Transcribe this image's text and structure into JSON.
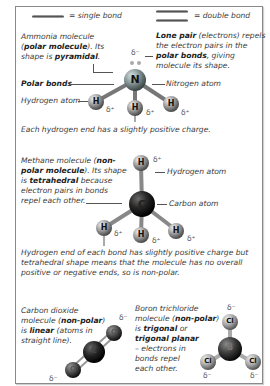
{
  "legend": {
    "single_bond": "= single bond",
    "double_bond": "= double bond"
  },
  "ammonia": {
    "desc_1": "Ammonia molecule",
    "desc_2a": "(",
    "desc_2b": "polar molecule",
    "desc_2c": "). Its",
    "desc_3a": "shape is ",
    "desc_3b": "pyramidal",
    "desc_3c": ".",
    "lone_pair_1a": "Lone pair",
    "lone_pair_1b": " (electrons) repels",
    "lone_pair_2": "the electron pairs in the",
    "lone_pair_3a": "polar bonds",
    "lone_pair_3b": ", giving",
    "lone_pair_4": "molecule its shape.",
    "polar_bonds_label": "Polar bonds",
    "nitrogen_label": "Nitrogen atom",
    "hydrogen_label": "Hydrogen atom",
    "caption": "Each hydrogen end has a slightly positive charge.",
    "atoms": {
      "center": "N",
      "h": "H"
    },
    "charges": {
      "neg": "δ⁻",
      "pos": "δ⁺"
    }
  },
  "methane": {
    "desc_1a": "Methane molecule (",
    "desc_1b": "non-",
    "desc_2a": "polar molecule",
    "desc_2b": "). Its shape",
    "desc_3a": "is ",
    "desc_3b": "tetrahedral",
    "desc_3c": " because",
    "desc_4": "electron pairs in bonds",
    "desc_5": "repel each other.",
    "hydrogen_label": "Hydrogen atom",
    "carbon_label": "Carbon atom",
    "caption_1": "Hydrogen end of each bond has slightly positive charge but",
    "caption_2": "tetrahedral shape means that the molecule has no overall",
    "caption_3": "positive or negative ends, so is non-polar.",
    "atoms": {
      "center": "C",
      "h": "H"
    },
    "charges": {
      "pos": "δ⁺"
    }
  },
  "co2": {
    "desc_1": "Carbon dioxide",
    "desc_2a": "molecule (",
    "desc_2b": "non-polar",
    "desc_2c": ")",
    "desc_3a": "is ",
    "desc_3b": "linear",
    "desc_3c": " (atoms in",
    "desc_4": "straight line).",
    "atoms": {
      "center": "C",
      "o": "O"
    },
    "charges": {
      "neg": "δ⁻"
    }
  },
  "bcl3": {
    "desc_1": "Boron trichloride",
    "desc_2a": "molecule (",
    "desc_2b": "non-polar",
    "desc_2c": ")",
    "desc_3a": "is ",
    "desc_3b": "trigonal",
    "desc_3c": " or",
    "desc_4": "trigonal planar",
    "desc_5": "– electrons in",
    "desc_6": "bonds repel",
    "desc_7": "each other.",
    "atoms": {
      "center": "B",
      "cl": "Cl"
    },
    "charges": {
      "neg": "δ⁻"
    }
  }
}
